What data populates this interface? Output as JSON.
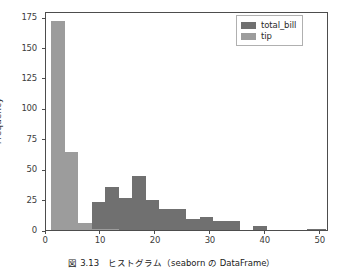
{
  "figure": {
    "caption": "図 3.13　ヒストグラム（seaborn の DataFrame）",
    "background": "#ffffff"
  },
  "chart_data": {
    "type": "bar",
    "title": "",
    "xlabel": "",
    "ylabel": "Frequency",
    "xlim": [
      0,
      51.5
    ],
    "ylim": [
      0,
      180
    ],
    "grid": false,
    "legend_position": "upper right",
    "xticks": [
      0,
      10,
      20,
      30,
      40,
      50
    ],
    "yticks": [
      0,
      25,
      50,
      75,
      100,
      125,
      150,
      175
    ],
    "bin_edges": [
      1.0,
      3.45,
      5.9,
      8.35,
      10.8,
      13.25,
      15.7,
      18.15,
      20.6,
      23.05,
      25.5,
      27.95,
      30.4,
      32.85,
      35.3,
      37.75,
      40.2,
      42.65,
      45.1,
      47.55,
      50.0,
      51.0
    ],
    "series": [
      {
        "name": "total_bill",
        "color": "#707070",
        "values": [
          0,
          0,
          6,
          23,
          35,
          26,
          44,
          25,
          17,
          17,
          9,
          11,
          7,
          7,
          0,
          3,
          0,
          0,
          0,
          1,
          1
        ]
      },
      {
        "name": "tip",
        "color": "#9c9c9c",
        "values": [
          172,
          64,
          6,
          1,
          1,
          0,
          0,
          0,
          0,
          0,
          0,
          0,
          0,
          0,
          0,
          0,
          0,
          0,
          0,
          0,
          0
        ]
      }
    ]
  },
  "legend": {
    "items": [
      {
        "label": "total_bill",
        "color": "#707070"
      },
      {
        "label": "tip",
        "color": "#9c9c9c"
      }
    ]
  }
}
